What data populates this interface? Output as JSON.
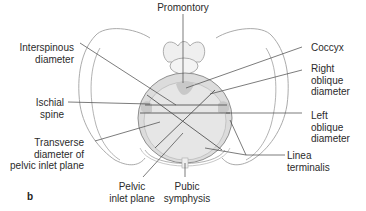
{
  "figure": {
    "panel_label": "b",
    "labels": {
      "promontory": "Promontory",
      "interspinous_1": "Interspinous",
      "interspinous_2": "diameter",
      "coccyx": "Coccyx",
      "right_oblique_1": "Right",
      "right_oblique_2": "oblique",
      "right_oblique_3": "diameter",
      "ischial_1": "Ischial",
      "ischial_2": "spine",
      "left_oblique_1": "Left",
      "left_oblique_2": "oblique",
      "left_oblique_3": "diameter",
      "transverse_1": "Transverse",
      "transverse_2": "diameter of",
      "transverse_3": "pelvic inlet plane",
      "linea_1": "Linea",
      "linea_2": "terminalis",
      "pelvic_inlet_1": "Pelvic",
      "pelvic_inlet_2": "inlet plane",
      "pubic_1": "Pubic",
      "pubic_2": "symphysis"
    },
    "colors": {
      "outline": "#9a9a9a",
      "inlet_fill": "#dcdcdc",
      "leader": "#444444",
      "text": "#2b2b2b"
    }
  }
}
